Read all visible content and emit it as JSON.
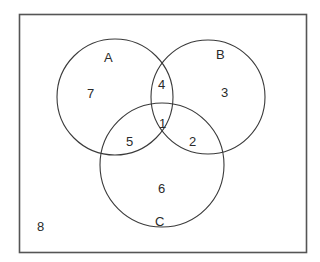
{
  "diagram": {
    "type": "venn-3",
    "sets": [
      {
        "id": "A",
        "label": "A"
      },
      {
        "id": "B",
        "label": "B"
      },
      {
        "id": "C",
        "label": "C"
      }
    ],
    "regions": {
      "A_only": "7",
      "B_only": "3",
      "C_only": "6",
      "A_and_B_only": "4",
      "A_and_C_only": "5",
      "B_and_C_only": "2",
      "A_and_B_and_C": "1",
      "outside": "8"
    },
    "colors": {
      "stroke": "#3a3a3a",
      "frame": "#555555",
      "text": "#2a2a2a",
      "background": "#ffffff"
    }
  }
}
